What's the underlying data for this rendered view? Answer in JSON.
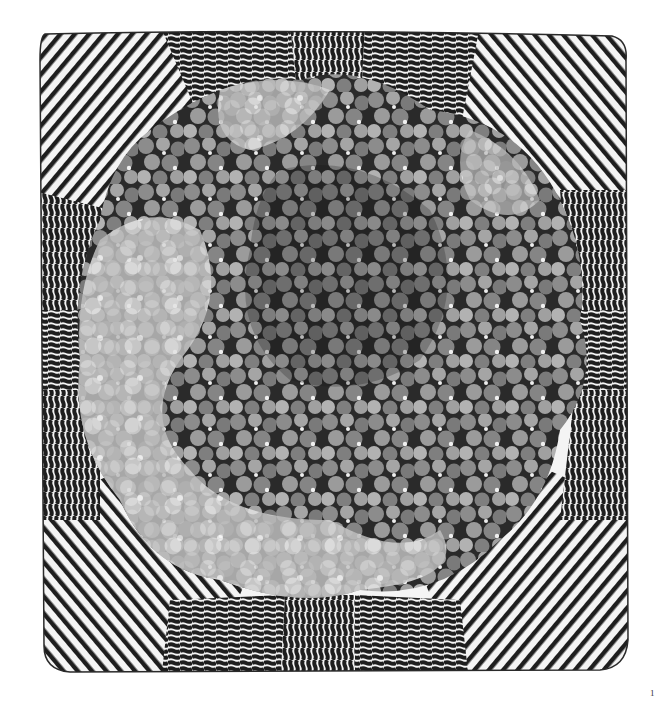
{
  "figure": {
    "colors": {
      "background": "#ffffff",
      "stripe": "#1e1e1e",
      "stripe_gap": "#f4f4f4",
      "center_dark": "#151515",
      "center_mid": "#7a7a7a",
      "center_light": "#c8c8c8",
      "center_highlight": "#ececec"
    }
  },
  "page_number": "1"
}
